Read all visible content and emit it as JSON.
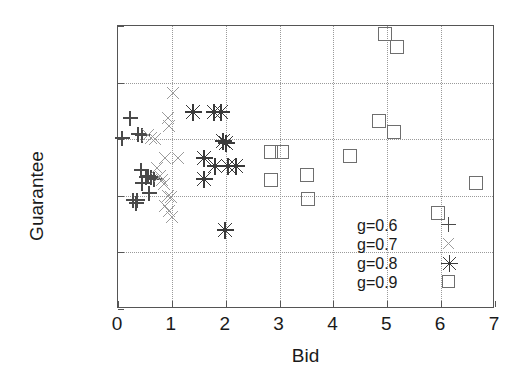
{
  "chart_data": {
    "type": "scatter",
    "title": "",
    "xlabel": "Bid",
    "ylabel": "Guarantee",
    "xlim": [
      0,
      7
    ],
    "ylim": [
      0,
      1
    ],
    "xticks": [
      "0",
      "1",
      "2",
      "3",
      "4",
      "5",
      "6",
      "7"
    ],
    "yticks": [
      "0",
      "0.2",
      "0.4",
      "0.6",
      "0.8",
      "1"
    ],
    "xtick_values": [
      0,
      1,
      2,
      3,
      4,
      5,
      6,
      7
    ],
    "ytick_values": [
      0,
      0.2,
      0.4,
      0.6,
      0.8,
      1
    ],
    "grid": true,
    "legend_position": "bottom-right",
    "series": [
      {
        "name": "g=0.6",
        "marker": "plus",
        "color": "#4a4a4a",
        "points": [
          [
            0.08,
            0.605
          ],
          [
            0.22,
            0.675
          ],
          [
            0.38,
            0.62
          ],
          [
            0.44,
            0.615
          ],
          [
            0.28,
            0.385
          ],
          [
            0.33,
            0.375
          ],
          [
            0.36,
            0.385
          ],
          [
            0.42,
            0.49
          ],
          [
            0.45,
            0.445
          ],
          [
            0.52,
            0.465
          ],
          [
            0.56,
            0.47
          ],
          [
            0.58,
            0.41
          ],
          [
            0.62,
            0.465
          ],
          [
            0.66,
            0.46
          ]
        ]
      },
      {
        "name": "g=0.7",
        "marker": "cross",
        "color": "#9b9b9b",
        "points": [
          [
            1.02,
            0.765
          ],
          [
            0.92,
            0.675
          ],
          [
            0.95,
            0.645
          ],
          [
            0.55,
            0.615
          ],
          [
            0.62,
            0.605
          ],
          [
            0.68,
            0.6
          ],
          [
            0.88,
            0.535
          ],
          [
            1.12,
            0.535
          ],
          [
            0.72,
            0.5
          ],
          [
            0.78,
            0.47
          ],
          [
            0.82,
            0.455
          ],
          [
            0.86,
            0.44
          ],
          [
            0.92,
            0.4
          ],
          [
            0.98,
            0.395
          ],
          [
            0.88,
            0.365
          ],
          [
            0.95,
            0.345
          ],
          [
            1.0,
            0.325
          ]
        ]
      },
      {
        "name": "g=0.8",
        "marker": "asterisk",
        "color": "#3a3a3a",
        "points": [
          [
            1.4,
            0.695
          ],
          [
            1.78,
            0.695
          ],
          [
            1.92,
            0.695
          ],
          [
            1.95,
            0.595
          ],
          [
            2.0,
            0.585
          ],
          [
            1.6,
            0.535
          ],
          [
            1.8,
            0.505
          ],
          [
            2.05,
            0.505
          ],
          [
            2.2,
            0.505
          ],
          [
            1.6,
            0.46
          ],
          [
            1.98,
            0.28
          ]
        ]
      },
      {
        "name": "g=0.9",
        "marker": "square",
        "color": "#6e6e6e",
        "points": [
          [
            4.95,
            0.97
          ],
          [
            5.18,
            0.925
          ],
          [
            4.85,
            0.665
          ],
          [
            5.12,
            0.625
          ],
          [
            2.85,
            0.555
          ],
          [
            3.05,
            0.555
          ],
          [
            4.3,
            0.54
          ],
          [
            3.5,
            0.475
          ],
          [
            2.85,
            0.455
          ],
          [
            3.52,
            0.39
          ],
          [
            6.65,
            0.445
          ],
          [
            5.95,
            0.34
          ]
        ]
      }
    ]
  },
  "legend": {
    "entries": [
      {
        "label": "g=0.6",
        "marker": "plus"
      },
      {
        "label": "g=0.7",
        "marker": "cross"
      },
      {
        "label": "g=0.8",
        "marker": "asterisk"
      },
      {
        "label": "g=0.9",
        "marker": "square"
      }
    ]
  }
}
